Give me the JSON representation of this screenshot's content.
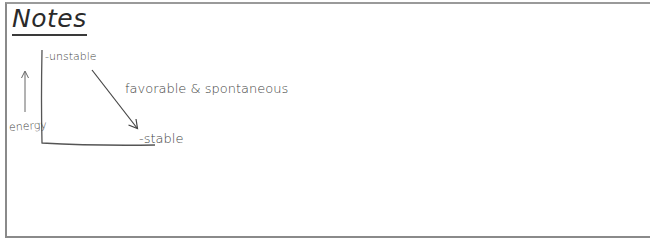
{
  "title": "Notes",
  "diagram": {
    "y_axis_label": "energy",
    "top_label": "-unstable",
    "bottom_label": "-stable",
    "arrow_annotation": "favorable & spontaneous"
  },
  "colors": {
    "ink": "#444444",
    "frame": "#8a8a8a",
    "background": "#ffffff"
  }
}
